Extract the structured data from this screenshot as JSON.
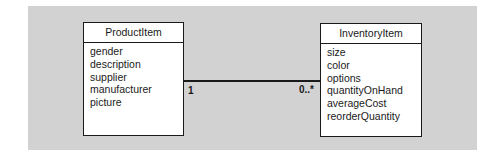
{
  "diagram": {
    "type": "UML class diagram",
    "colors": {
      "panel_background": "#d2d2d2",
      "box_background": "#ffffff",
      "stroke": "#1a1a1a"
    },
    "classes": [
      {
        "name": "ProductItem",
        "attributes": [
          "gender",
          "description",
          "supplier",
          "manufacturer",
          "picture"
        ]
      },
      {
        "name": "InventoryItem",
        "attributes": [
          "size",
          "color",
          "options",
          "quantityOnHand",
          "averageCost",
          "reorderQuantity"
        ]
      }
    ],
    "association": {
      "from": "ProductItem",
      "to": "InventoryItem",
      "from_multiplicity": "1",
      "to_multiplicity": "0..*"
    }
  }
}
